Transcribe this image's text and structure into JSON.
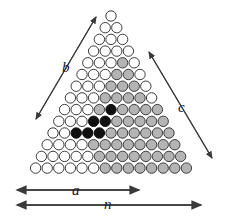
{
  "figure": {
    "rows": 14,
    "apex": {
      "x": 111.0,
      "y": 16.0
    },
    "spacing": {
      "dx": 11.6,
      "dy": 11.7
    },
    "circle_radius": 5.2,
    "colors": {
      "white_fill": "#ffffff",
      "gray_fill": "#b4b4b4",
      "black_fill": "#111111",
      "stroke": "#3c3c3c",
      "arrow": "#3a3a3a",
      "text": "#1a1a1a"
    },
    "regions": {
      "gray_triangle": {
        "top_row": 5,
        "bottom_row": 11,
        "note": "large shaded triangle"
      },
      "white_inner_triangle": {
        "top_row": 5,
        "bottom_row": 8,
        "note": "unshaded triangle inside gray"
      },
      "black_triangle": {
        "top_row": 9,
        "bottom_row": 11,
        "counts": [
          1,
          2,
          3
        ]
      },
      "gray_trapezoid_lower": {
        "top_row": 12,
        "bottom_row": 14,
        "note": "shaded band continuing down"
      }
    }
  },
  "labels": {
    "b": "b",
    "c": "c",
    "a": "a",
    "n": "n"
  },
  "label_positions": {
    "b": {
      "x": 62,
      "y": 60
    },
    "c": {
      "x": 178,
      "y": 100
    },
    "a": {
      "x": 72,
      "y": 183
    },
    "n": {
      "x": 104,
      "y": 197
    }
  },
  "arrows": {
    "b": {
      "x1": 36,
      "y1": 119,
      "x2": 96,
      "y2": 17,
      "double": true
    },
    "c": {
      "x1": 149,
      "y1": 52,
      "x2": 212,
      "y2": 158,
      "double": true
    },
    "a": {
      "x1": 17,
      "y1": 190,
      "x2": 139,
      "y2": 190,
      "double": true
    },
    "n": {
      "x1": 17,
      "y1": 205,
      "x2": 201,
      "y2": 205,
      "double": true
    }
  }
}
